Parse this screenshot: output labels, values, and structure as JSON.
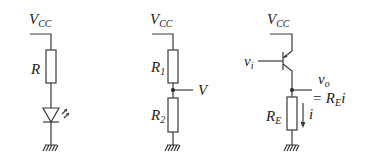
{
  "diagram": {
    "type": "circuit-schematics",
    "colors": {
      "line": "#3a3a3a",
      "text": "#222222",
      "background": "#ffffff"
    },
    "circuits": [
      {
        "id": "led-circuit",
        "supply": {
          "main": "V",
          "sub": "CC"
        },
        "resistor": {
          "main": "R",
          "sub": ""
        },
        "components": [
          "resistor",
          "led",
          "ground"
        ]
      },
      {
        "id": "voltage-divider",
        "supply": {
          "main": "V",
          "sub": "CC"
        },
        "r1": {
          "main": "R",
          "sub": "1"
        },
        "r2": {
          "main": "R",
          "sub": "2"
        },
        "output": {
          "main": "V"
        },
        "components": [
          "resistor",
          "resistor",
          "output-node",
          "ground"
        ]
      },
      {
        "id": "emitter-follower",
        "supply": {
          "main": "V",
          "sub": "CC"
        },
        "input": {
          "main": "v",
          "sub": "i"
        },
        "output": {
          "main": "v",
          "sub": "o"
        },
        "output_eq": {
          "prefix": "= R",
          "sub": "E",
          "suffix": "i"
        },
        "resistor": {
          "main": "R",
          "sub": "E"
        },
        "current": {
          "main": "i"
        },
        "components": [
          "transistor",
          "resistor",
          "current-arrow",
          "output-node",
          "ground"
        ]
      }
    ]
  }
}
